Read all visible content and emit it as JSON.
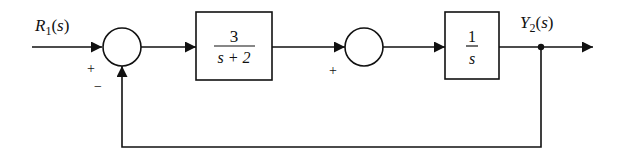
{
  "diagram": {
    "type": "block-diagram",
    "input": {
      "symbol": "R",
      "subscript": "1",
      "arg": "(s)"
    },
    "output": {
      "symbol": "Y",
      "subscript": "2",
      "arg": "(s)"
    },
    "summing_junction_1": {
      "signs": {
        "left": "+",
        "bottom": "−"
      }
    },
    "summing_junction_2": {
      "signs": {
        "left": "+"
      }
    },
    "block_1": {
      "numerator": "3",
      "denominator": "s + 2"
    },
    "block_2": {
      "numerator": "1",
      "denominator": "s"
    },
    "feedback": {
      "from": "Y2(s) takeoff point",
      "to": "summing junction 1 (negative)",
      "gain": "unity"
    },
    "colors": {
      "stroke": "#111111",
      "background": "#ffffff"
    }
  }
}
